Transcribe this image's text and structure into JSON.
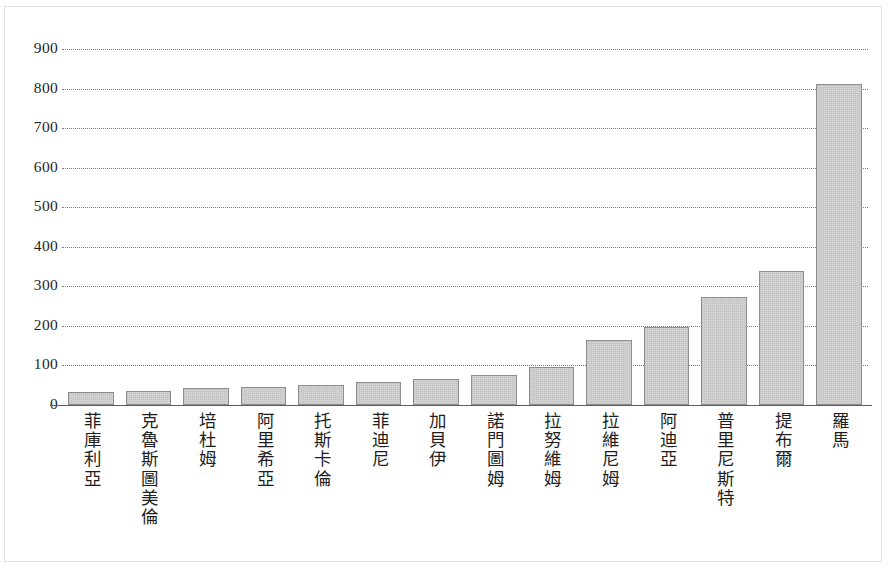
{
  "chart_data": {
    "type": "bar",
    "title": "",
    "subtitle": "",
    "xlabel": "",
    "ylabel": "",
    "categories": [
      "菲庫利亞",
      "克魯斯圖美倫",
      "培杜姆",
      "阿里希亞",
      "托斯卡倫",
      "菲迪尼",
      "加貝伊",
      "諾門圖姆",
      "拉努維姆",
      "拉維尼姆",
      "阿迪亞",
      "普里尼斯特",
      "提布爾",
      "羅馬"
    ],
    "values": [
      33,
      35,
      42,
      45,
      50,
      58,
      67,
      77,
      95,
      165,
      198,
      272,
      340,
      812
    ],
    "series": [
      {
        "name": "",
        "values": [
          33,
          35,
          42,
          45,
          50,
          58,
          67,
          77,
          95,
          165,
          198,
          272,
          340,
          812
        ]
      }
    ],
    "ylim": [
      0,
      900
    ],
    "ytick_values": [
      0,
      100,
      200,
      300,
      400,
      500,
      600,
      700,
      800,
      900
    ],
    "ytick_labels": [
      "0",
      "100",
      "200",
      "300",
      "400",
      "500",
      "600",
      "700",
      "800",
      "900"
    ],
    "grid": "horizontal-dotted",
    "legend": "none",
    "annotations": []
  },
  "style": {
    "bar_fill": "#d6d6d4",
    "bar_stroke": "#8d8d8d",
    "grid_color": "#7b7b7b",
    "axis_color": "#5d5d5d",
    "text_color": "#1f1f1f",
    "background": "#ffffff"
  }
}
